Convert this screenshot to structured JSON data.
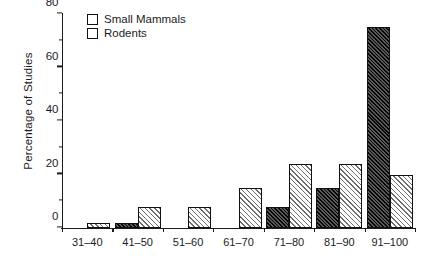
{
  "chart_data": {
    "type": "bar",
    "title": "",
    "xlabel": "",
    "ylabel": "Percentage of Studies",
    "categories": [
      "31–40",
      "41–50",
      "51–60",
      "61–70",
      "71–80",
      "81–90",
      "91–100"
    ],
    "series": [
      {
        "name": "Small Mammals",
        "values": [
          0,
          2,
          0,
          0,
          8,
          15,
          75
        ],
        "pattern": "dense-diagonal-hatch",
        "color": "#2b2b2b"
      },
      {
        "name": "Rodents",
        "values": [
          2,
          8,
          8,
          15,
          24,
          24,
          20
        ],
        "pattern": "sparse-diagonal-hatch",
        "color": "#ffffff"
      }
    ],
    "ylim": [
      0,
      80
    ],
    "yticks": [
      0,
      20,
      40,
      60,
      80
    ],
    "yticks_minor": [
      10,
      30,
      50,
      70
    ],
    "grid": false,
    "legend_position": "top-left-inside"
  },
  "legend": {
    "items": [
      {
        "label": "Small Mammals"
      },
      {
        "label": "Rodents"
      }
    ]
  },
  "caption": {
    "text": ""
  }
}
